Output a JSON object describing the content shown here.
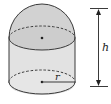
{
  "diagram": {
    "type": "geometry-solid",
    "labels": {
      "height": "h",
      "radius": "r"
    },
    "colors": {
      "fill_light": "#e4e4e4",
      "fill_dark": "#cfcfcf",
      "stroke": "#3a3a3a",
      "background": "#ffffff"
    }
  }
}
